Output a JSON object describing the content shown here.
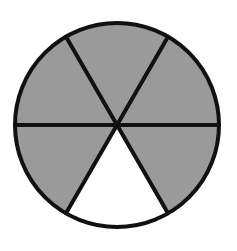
{
  "figure": {
    "total_parts": 6,
    "shaded_parts": 5,
    "unshaded_parts": 1,
    "fraction_shaded": "5/6"
  },
  "geometry": {
    "cx": 117,
    "cy": 125,
    "r": 102,
    "sectors": [
      {
        "index": 0,
        "start_deg": 0,
        "end_deg": 60,
        "shaded": true
      },
      {
        "index": 1,
        "start_deg": 60,
        "end_deg": 120,
        "shaded": false
      },
      {
        "index": 2,
        "start_deg": 120,
        "end_deg": 180,
        "shaded": true
      },
      {
        "index": 3,
        "start_deg": 180,
        "end_deg": 240,
        "shaded": true
      },
      {
        "index": 4,
        "start_deg": 240,
        "end_deg": 300,
        "shaded": true
      },
      {
        "index": 5,
        "start_deg": 300,
        "end_deg": 360,
        "shaded": true
      }
    ]
  },
  "colors": {
    "shaded": "#9a9a9a",
    "unshaded": "#ffffff",
    "stroke": "#111111",
    "background": "#ffffff"
  },
  "stroke_width": 4
}
